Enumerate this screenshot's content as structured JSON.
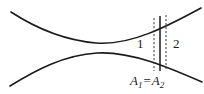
{
  "figure": {
    "background_color": "#ffffff",
    "line_color": "#1a1a1a",
    "labels": {
      "section_1": "1",
      "section_2": "2"
    },
    "equation": {
      "full_text": "A1 = A2",
      "left_symbol": "A",
      "left_subscript": "1",
      "operator": "=",
      "right_symbol": "A",
      "right_subscript": "2"
    },
    "geometry": {
      "upper_wall": {
        "description": "upper channel wall curve",
        "path": "M 11 12 C 34 27, 62 40, 96 43 C 130 46, 168 26, 201 8"
      },
      "lower_wall": {
        "description": "lower channel wall curve",
        "path": "M 10 86 C 36 70, 64 55, 97 53 C 131 51, 170 68, 202 82"
      },
      "solid_section_line": {
        "description": "solid vertical cross-section line",
        "x": 160,
        "y_top": 16,
        "y_bottom": 71
      },
      "dashed_section_line_left": {
        "description": "dashed vertical cross-section line for station 1",
        "x": 154,
        "y_top": 18,
        "y_bottom": 71
      },
      "dashed_section_line_right": {
        "description": "dashed vertical cross-section line for station 2",
        "x": 166,
        "y_top": 15,
        "y_bottom": 71
      }
    }
  }
}
